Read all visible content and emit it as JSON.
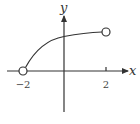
{
  "diagram": {
    "type": "function-graph",
    "axes": {
      "x_label": "x",
      "y_label": "y",
      "x_ticks": [
        {
          "value": -2,
          "label": "−2"
        },
        {
          "value": 2,
          "label": "2"
        }
      ]
    },
    "curve": {
      "description": "increasing concave-down curve from (-2, 0) to (2, ~0.95)",
      "start": {
        "x": -2,
        "y": 0,
        "endpoint": "open"
      },
      "end": {
        "x": 2,
        "y": 0.95,
        "endpoint": "open"
      },
      "y_intercept_approx": 0.85
    },
    "colors": {
      "stroke": "#333333",
      "background": "#ffffff"
    }
  }
}
